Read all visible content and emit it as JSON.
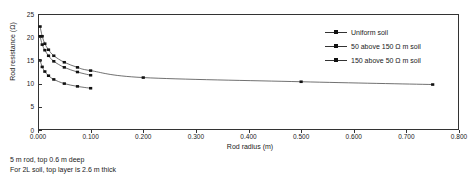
{
  "chart_data": {
    "type": "line",
    "title": "",
    "xlabel": "Rod radius (m)",
    "ylabel": "Rod resistance (Ω)",
    "xlim": [
      0.0,
      0.8
    ],
    "ylim": [
      0,
      25
    ],
    "xticks": [
      "0.000",
      "0.100",
      "0.200",
      "0.300",
      "0.400",
      "0.500",
      "0.600",
      "0.700",
      "0.800"
    ],
    "xtick_values": [
      0.0,
      0.1,
      0.2,
      0.3,
      0.4,
      0.5,
      0.6,
      0.7,
      0.8
    ],
    "yticks": [
      "0",
      "5",
      "10",
      "15",
      "20",
      "25"
    ],
    "ytick_values": [
      0,
      5,
      10,
      15,
      20,
      25
    ],
    "grid": false,
    "legend_position": "upper right",
    "marker": "square",
    "series": [
      {
        "name": "Uniform soil",
        "x": [
          0.004,
          0.008,
          0.013,
          0.02,
          0.03,
          0.05,
          0.075,
          0.1,
          0.2,
          0.5,
          0.75
        ],
        "y": [
          22.3,
          20.2,
          18.6,
          17.3,
          16.0,
          14.6,
          13.5,
          12.8,
          11.3,
          10.4,
          9.8
        ]
      },
      {
        "name": "50 above 150 Ω m soil",
        "x": [
          0.004,
          0.008,
          0.013,
          0.02,
          0.03,
          0.05,
          0.075,
          0.1
        ],
        "y": [
          20.2,
          18.4,
          17.2,
          16.0,
          14.8,
          13.5,
          12.5,
          11.8
        ]
      },
      {
        "name": "150 above 50 Ω m soil",
        "x": [
          0.004,
          0.008,
          0.013,
          0.02,
          0.03,
          0.05,
          0.075,
          0.1
        ],
        "y": [
          15.0,
          13.6,
          12.6,
          11.7,
          10.9,
          10.0,
          9.4,
          9.0
        ]
      }
    ]
  },
  "legend": {
    "items": [
      {
        "label": "Uniform soil"
      },
      {
        "label": "50 above 150 Ω m soil"
      },
      {
        "label": "150 above 50 Ω m soil"
      }
    ]
  },
  "caption": {
    "line1": "5 m rod, top 0.6 m deep",
    "line2": "For 2L soil, top layer is 2.6 m thick"
  },
  "colors": {
    "line": "#333333",
    "marker": "#111111",
    "axis": "#333333",
    "text": "#1a1a1a",
    "background": "#ffffff"
  }
}
